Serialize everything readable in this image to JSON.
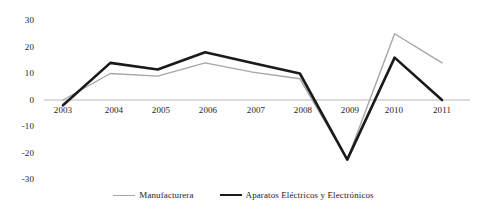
{
  "chart_data": {
    "type": "line",
    "title": "",
    "subtitle": "",
    "xlabel": "",
    "ylabel": "",
    "categories": [
      "2003",
      "2004",
      "2005",
      "2006",
      "2007",
      "2008",
      "2009",
      "2010",
      "2011"
    ],
    "series": [
      {
        "name": "Manufacturera",
        "color": "#a6a6a6",
        "line_width": 1.4,
        "values": [
          0,
          10,
          9,
          14,
          10.5,
          8,
          -22.5,
          25,
          14
        ]
      },
      {
        "name": "Aparatos Eléctricos y Electrónicos",
        "color": "#1a1a1a",
        "line_width": 2.6,
        "values": [
          -2,
          14,
          11.5,
          18,
          14,
          10,
          -22.5,
          16,
          0
        ]
      }
    ],
    "ylim": [
      -30,
      30
    ],
    "yticks": [
      "30",
      "20",
      "10",
      "0",
      "-10",
      "-20",
      "-30"
    ],
    "ytick_values": [
      30,
      20,
      10,
      0,
      -10,
      -20,
      -30
    ],
    "grid": false,
    "zero_line": true,
    "zero_line_color": "#b7b7b7",
    "legend_position": "bottom"
  },
  "legend": {
    "entries": [
      {
        "label": "Manufacturera",
        "marker": "thin-gray-line"
      },
      {
        "label": "Aparatos Eléctricos y Electrónicos",
        "marker": "thick-black-line"
      }
    ]
  },
  "axis": {
    "y_labels": [
      "30",
      "20",
      "10",
      "0",
      "-10",
      "-20",
      "-30"
    ],
    "x_labels": [
      "2003",
      "2004",
      "2005",
      "2006",
      "2007",
      "2008",
      "2009",
      "2010",
      "2011"
    ]
  }
}
